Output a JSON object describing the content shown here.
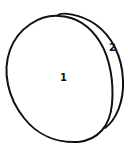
{
  "diagram": {
    "type": "line-drawing",
    "parts": [
      {
        "id": "face",
        "label": "1"
      },
      {
        "id": "edge",
        "label": "2"
      }
    ],
    "stroke_color": "#111111",
    "background": "#ffffff"
  }
}
